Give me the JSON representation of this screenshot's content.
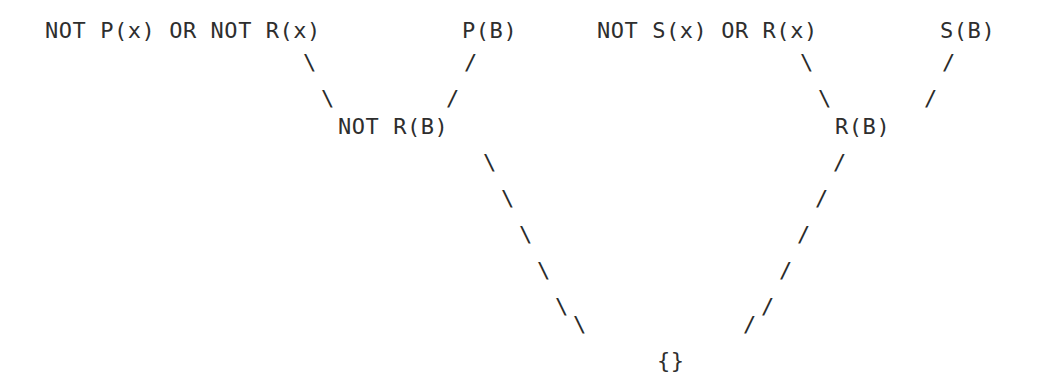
{
  "document": {
    "kind": "resolution-refutation-tree",
    "background_color": "#ffffff",
    "text_color": "#2b2b2b",
    "grid": {
      "char_width": 17.8,
      "line_height": 36,
      "origin_x": 45,
      "origin_y": 18
    }
  },
  "clauses": [
    {
      "id": "premise-not-p-or-not-r",
      "text": "NOT P(x) OR NOT R(x)",
      "level": "premise",
      "x": 45,
      "y": 18
    },
    {
      "id": "premise-p-b",
      "text": "P(B)",
      "level": "premise",
      "x": 462,
      "y": 18
    },
    {
      "id": "premise-not-s-or-r",
      "text": "NOT S(x) OR R(x)",
      "level": "premise",
      "x": 597,
      "y": 18
    },
    {
      "id": "premise-s-b",
      "text": "S(B)",
      "level": "premise",
      "x": 940,
      "y": 18
    },
    {
      "id": "resolvent-not-r-b",
      "text": "NOT R(B)",
      "level": "resolvent",
      "x": 338,
      "y": 114
    },
    {
      "id": "resolvent-r-b",
      "text": "R(B)",
      "level": "resolvent",
      "x": 835,
      "y": 114
    },
    {
      "id": "empty-clause",
      "text": "{}",
      "level": "conclusion",
      "x": 657,
      "y": 348
    }
  ],
  "edges": [
    {
      "id": "edge-left-premise-to-not-r-b",
      "from": "premise-not-p-or-not-r",
      "to": "resolvent-not-r-b",
      "direction": "down-right",
      "strokes": [
        {
          "glyph": "\\",
          "x": 303,
          "y": 50
        },
        {
          "glyph": "\\",
          "x": 321,
          "y": 86
        }
      ]
    },
    {
      "id": "edge-p-b-to-not-r-b",
      "from": "premise-p-b",
      "to": "resolvent-not-r-b",
      "direction": "down-left",
      "strokes": [
        {
          "glyph": "/",
          "x": 464,
          "y": 50
        },
        {
          "glyph": "/",
          "x": 446,
          "y": 86
        }
      ]
    },
    {
      "id": "edge-right-premise-to-r-b",
      "from": "premise-not-s-or-r",
      "to": "resolvent-r-b",
      "direction": "down-right",
      "strokes": [
        {
          "glyph": "\\",
          "x": 800,
          "y": 50
        },
        {
          "glyph": "\\",
          "x": 818,
          "y": 86
        }
      ]
    },
    {
      "id": "edge-s-b-to-r-b",
      "from": "premise-s-b",
      "to": "resolvent-r-b",
      "direction": "down-left",
      "strokes": [
        {
          "glyph": "/",
          "x": 942,
          "y": 50
        },
        {
          "glyph": "/",
          "x": 924,
          "y": 86
        }
      ]
    },
    {
      "id": "edge-not-r-b-to-empty",
      "from": "resolvent-not-r-b",
      "to": "empty-clause",
      "direction": "down-right",
      "strokes": [
        {
          "glyph": "\\",
          "x": 483,
          "y": 150
        },
        {
          "glyph": "\\",
          "x": 501,
          "y": 186
        },
        {
          "glyph": "\\",
          "x": 519,
          "y": 222
        },
        {
          "glyph": "\\",
          "x": 537,
          "y": 258
        },
        {
          "glyph": "\\",
          "x": 555,
          "y": 294
        },
        {
          "glyph": "\\",
          "x": 573,
          "y": 312
        }
      ]
    },
    {
      "id": "edge-r-b-to-empty",
      "from": "resolvent-r-b",
      "to": "empty-clause",
      "direction": "down-left",
      "strokes": [
        {
          "glyph": "/",
          "x": 833,
          "y": 150
        },
        {
          "glyph": "/",
          "x": 815,
          "y": 186
        },
        {
          "glyph": "/",
          "x": 797,
          "y": 222
        },
        {
          "glyph": "/",
          "x": 779,
          "y": 258
        },
        {
          "glyph": "/",
          "x": 761,
          "y": 294
        },
        {
          "glyph": "/",
          "x": 743,
          "y": 312
        }
      ]
    }
  ]
}
